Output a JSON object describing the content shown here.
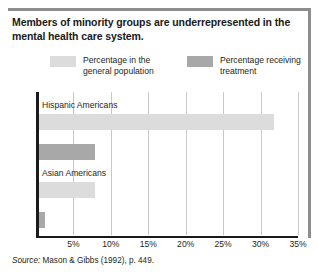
{
  "figure": {
    "title": "Members of minority groups are underrepresented in the mental health care system.",
    "source_prefix": "Source:",
    "source_text": "Mason & Gibbs (1992), p. 449."
  },
  "legend": {
    "items": [
      {
        "label": "Percentage in the\ngeneral population",
        "color": "#dcdcdc",
        "name": "general-population"
      },
      {
        "label": "Percentage receiving\ntreatment",
        "color": "#a8a8a8",
        "name": "receiving-treatment"
      }
    ]
  },
  "chart_data": {
    "type": "bar",
    "orientation": "horizontal",
    "title": "Members of minority groups are underrepresented in the mental health care system.",
    "xlabel": "",
    "ylabel": "",
    "categories": [
      "Hispanic Americans",
      "Asian Americans"
    ],
    "series": [
      {
        "name": "Percentage in the general population",
        "color": "#dcdcdc",
        "values": [
          31.5,
          7.6
        ]
      },
      {
        "name": "Percentage receiving treatment",
        "color": "#a8a8a8",
        "values": [
          7.6,
          1.0
        ]
      }
    ],
    "xlim": [
      0,
      35
    ],
    "xticks": [
      5,
      10,
      15,
      20,
      25,
      30,
      35
    ],
    "xtick_labels": [
      "5%",
      "10%",
      "15%",
      "20%",
      "25%",
      "30%",
      "35%"
    ],
    "grid": true,
    "legend_position": "top"
  }
}
